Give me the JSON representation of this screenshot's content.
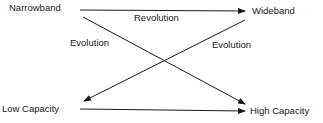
{
  "nodes": {
    "top_left": "Narrowband",
    "top_right": "Wideband",
    "bottom_left": "Low Capacity",
    "bottom_right": "High Capacity"
  },
  "edge_labels": {
    "top": "Revolution",
    "left_diagonal": "Evolution",
    "right_diagonal": "Evolution"
  },
  "colors": {
    "line": "#1a1a1a",
    "text": "#1a1a1a"
  }
}
